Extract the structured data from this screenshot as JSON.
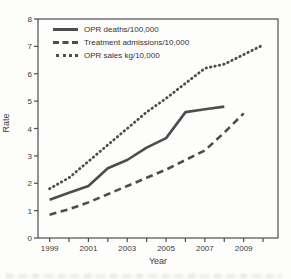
{
  "chart_data": {
    "type": "line",
    "title": "",
    "xlabel": "Year",
    "ylabel": "Rate",
    "xlim": [
      1998.4,
      2010.77
    ],
    "ylim": [
      0,
      8
    ],
    "y_ticks": [
      0,
      1,
      2,
      3,
      4,
      5,
      6,
      7,
      8
    ],
    "x_ticks": [
      1999,
      2000,
      2001,
      2002,
      2003,
      2004,
      2005,
      2006,
      2007,
      2008,
      2009,
      2010
    ],
    "x_labeled_ticks": [
      1999,
      2001,
      2003,
      2005,
      2007,
      2009
    ],
    "grid": false,
    "legend_position": "top-left-inside",
    "line_color": "#4d4d4d",
    "text_color": "#3b3b3b",
    "series": [
      {
        "name": "OPR deaths/100,000",
        "style": "solid",
        "x": [
          1999,
          2000,
          2001,
          2002,
          2003,
          2004,
          2005,
          2006,
          2007,
          2008
        ],
        "values": [
          1.4,
          1.65,
          1.9,
          2.55,
          2.85,
          3.3,
          3.65,
          4.6,
          4.7,
          4.8
        ]
      },
      {
        "name": "Treatment admissions/10,000",
        "style": "dashed",
        "x": [
          1999,
          2000,
          2001,
          2002,
          2003,
          2004,
          2005,
          2006,
          2007,
          2008,
          2009
        ],
        "values": [
          0.85,
          1.05,
          1.3,
          1.6,
          1.9,
          2.2,
          2.5,
          2.85,
          3.2,
          3.85,
          4.55
        ]
      },
      {
        "name": "OPR sales kg/10,000",
        "style": "dotted",
        "x": [
          1999,
          2000,
          2001,
          2002,
          2003,
          2004,
          2005,
          2006,
          2007,
          2008,
          2009,
          2010
        ],
        "values": [
          1.8,
          2.2,
          2.8,
          3.4,
          4.0,
          4.6,
          5.1,
          5.65,
          6.2,
          6.35,
          6.7,
          7.05
        ]
      }
    ]
  }
}
